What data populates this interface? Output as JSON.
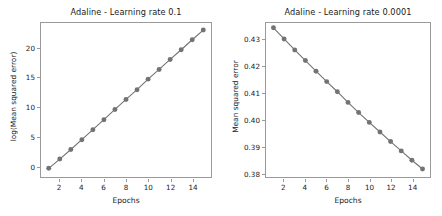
{
  "figure": {
    "background_color": "#ffffff",
    "series_color": "#737373",
    "axis_color": "#9a9a9a",
    "text_color": "#1a1a1a"
  },
  "chart_data": [
    {
      "id": "adaline-lr-0.1",
      "type": "line",
      "title": "Adaline - Learning rate 0.1",
      "xlabel": "Epochs",
      "ylabel": "log(Mean squared error)",
      "x": [
        1,
        2,
        3,
        4,
        5,
        6,
        7,
        8,
        9,
        10,
        11,
        12,
        13,
        14,
        15
      ],
      "values": [
        -0.42,
        1.15,
        2.78,
        4.45,
        6.15,
        7.85,
        9.6,
        11.3,
        12.95,
        14.75,
        16.4,
        18.1,
        19.75,
        21.45,
        23.1
      ],
      "xtick_labels": [
        "2",
        "4",
        "6",
        "8",
        "10",
        "12",
        "14"
      ],
      "xticks": [
        2,
        4,
        6,
        8,
        10,
        12,
        14
      ],
      "ytick_labels": [
        "0",
        "5",
        "10",
        "15",
        "20"
      ],
      "yticks": [
        0,
        5,
        10,
        15,
        20
      ],
      "xlim": [
        0.3,
        15.7
      ],
      "ylim": [
        -1.9,
        24.3
      ],
      "grid": false,
      "legend": null,
      "marker": "circle",
      "line_color": "#737373",
      "marker_color": "#737373"
    },
    {
      "id": "adaline-lr-0.0001",
      "type": "line",
      "title": "Adaline - Learning rate 0.0001",
      "xlabel": "Epochs",
      "ylabel": "Mean squared error",
      "x": [
        1,
        2,
        3,
        4,
        5,
        6,
        7,
        8,
        9,
        10,
        11,
        12,
        13,
        14,
        15
      ],
      "values": [
        0.4345,
        0.4303,
        0.4262,
        0.4222,
        0.4182,
        0.4143,
        0.4105,
        0.4065,
        0.4027,
        0.399,
        0.3954,
        0.3918,
        0.3883,
        0.3848,
        0.3815
      ],
      "xtick_labels": [
        "2",
        "4",
        "6",
        "8",
        "10",
        "12",
        "14"
      ],
      "xticks": [
        2,
        4,
        6,
        8,
        10,
        12,
        14
      ],
      "ytick_labels": [
        "0.38",
        "0.39",
        "0.40",
        "0.41",
        "0.42",
        "0.43"
      ],
      "yticks": [
        0.38,
        0.39,
        0.4,
        0.41,
        0.42,
        0.43
      ],
      "xlim": [
        0.3,
        15.7
      ],
      "ylim": [
        0.3785,
        0.4363
      ],
      "grid": false,
      "legend": null,
      "marker": "circle",
      "line_color": "#737373",
      "marker_color": "#737373"
    }
  ]
}
